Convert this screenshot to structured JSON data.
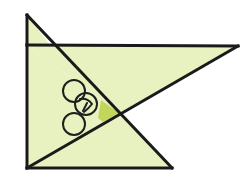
{
  "figure": {
    "caption": "",
    "background_color": "#ffffff",
    "fill_color": "#e8f2c0",
    "accent_fill_color": "#c3d65a",
    "stroke_color": "#1a1a1a",
    "circle_stroke_color": "#1f1f1f",
    "stroke_width": "3",
    "thin_stroke_width": "2",
    "canvas": {
      "width": 249,
      "height": 189
    },
    "points": {
      "top_apex": "27,15",
      "top_left": "27,45",
      "right_tip": "238,46",
      "bottom_left": "27,168",
      "bottom_right": "172,168",
      "crossing": "119,113",
      "apex_on_top_edge": "50,45"
    },
    "shapes": {
      "upper_small_triangle": "27,15 27,45 50,45",
      "upper_right_triangle": "27,45 238,46 119,113",
      "left_body_triangle": "27,45 119,113 27,168",
      "lower_right_triangle": "27,168 172,168 119,113",
      "angle_wedge": "119,113 101,100 98,118 103,122"
    },
    "lines": {
      "top_horizontal": "27,45 238,46",
      "left_vertical": "27,45 27,168",
      "bottom_horizontal": "27,168 172,168",
      "diagonal_from_apex": "27,15 172,168",
      "diagonal_from_tip": "238,46 27,168"
    },
    "circles": [
      {
        "name": "circle-upper",
        "cx": 74,
        "cy": 91,
        "r": 11
      },
      {
        "name": "circle-middle-marked",
        "cx": 86,
        "cy": 104,
        "r": 11
      },
      {
        "name": "circle-lower",
        "cx": 74,
        "cy": 124,
        "r": 11
      }
    ],
    "angle_mark": {
      "name": "angle-tick-mark",
      "path": "M 80 99 Q 88 98 92 104 Q 89 108 84 112",
      "tail": "M 87 103 L 83 111"
    }
  }
}
